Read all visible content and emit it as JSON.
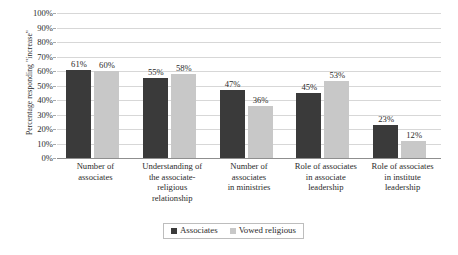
{
  "chart_data": {
    "type": "bar",
    "title": "",
    "subtitle": "",
    "xlabel": "",
    "ylabel": "Percentage responding \"increase\"",
    "ylim": [
      0,
      100
    ],
    "ytick_labels": [
      "100%",
      "90%",
      "80%",
      "70%",
      "60%",
      "50%",
      "40%",
      "30%",
      "20%",
      "10%",
      "0%"
    ],
    "ytick_values": [
      100,
      90,
      80,
      70,
      60,
      50,
      40,
      30,
      20,
      10,
      0
    ],
    "grid": "horizontal",
    "legend_position": "bottom",
    "categories": [
      "Number of associates",
      "Understanding of the associate-religious relationship",
      "Number of associates in ministries",
      "Role of associates in associate leadership",
      "Role of associates in institute leadership"
    ],
    "category_lines": [
      [
        "Number of",
        "associates"
      ],
      [
        "Understanding of",
        "the associate-",
        "religious",
        "relationship"
      ],
      [
        "Number of",
        "associates",
        "in ministries"
      ],
      [
        "Role of associates",
        "in associate",
        "leadership"
      ],
      [
        "Role of associates",
        "in institute",
        "leadership"
      ]
    ],
    "series": [
      {
        "name": "Associates",
        "color": "#3a3a3a",
        "values": [
          61,
          55,
          47,
          45,
          23
        ],
        "data_labels": [
          "61%",
          "55%",
          "47%",
          "45%",
          "23%"
        ]
      },
      {
        "name": "Vowed religious",
        "color": "#c8c8c8",
        "values": [
          60,
          58,
          36,
          53,
          12
        ],
        "data_labels": [
          "60%",
          "58%",
          "36%",
          "53%",
          "12%"
        ]
      }
    ]
  },
  "legend": {
    "items": [
      {
        "label": "Associates",
        "color": "#3a3a3a"
      },
      {
        "label": "Vowed religious",
        "color": "#c8c8c8"
      }
    ]
  },
  "colors": {
    "gridline": "#d7d7d7",
    "axis": "#8f8f8f",
    "text": "#2b2b2b",
    "legend_border": "#bdbdbd",
    "background": "#ffffff"
  }
}
